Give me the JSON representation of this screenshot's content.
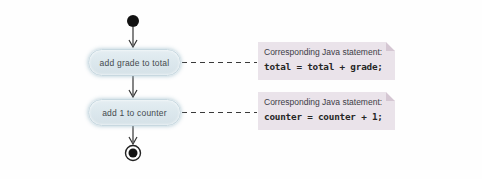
{
  "diagram": {
    "start_node": "initial-state",
    "end_node": "final-state",
    "actions": [
      {
        "label": "add grade to total"
      },
      {
        "label": "add 1 to counter"
      }
    ],
    "notes": [
      {
        "label": "Corresponding Java statement:",
        "code": "total = total + grade;"
      },
      {
        "label": "Corresponding Java statement:",
        "code": "counter = counter + 1;"
      }
    ],
    "colors": {
      "action_fill": "#dae6ec",
      "action_border": "#c7d8e0",
      "note_fill": "#eae3ea",
      "note_fold": "#d5c7d3",
      "line": "#333333",
      "text": "#3c3c46"
    }
  }
}
